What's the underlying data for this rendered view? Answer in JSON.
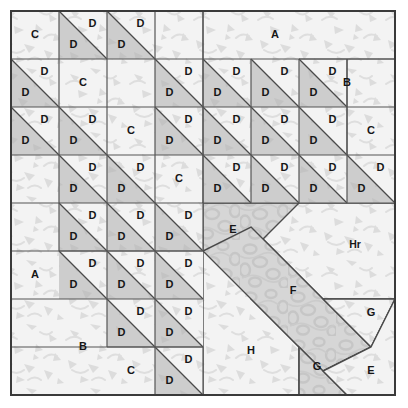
{
  "diagram": {
    "canvas": {
      "width": 408,
      "height": 408,
      "background": "#ffffff"
    },
    "grid": {
      "origin_x": 11,
      "origin_y": 11,
      "cell": 48,
      "columns": 8,
      "rows": 8,
      "line_color": "#555555",
      "border_color": "#3a3a3a"
    },
    "fabrics": {
      "background_light": "#f2f2f2",
      "light_print": "#efefef",
      "medium_gray": "#cfcfcf",
      "mottled_gray": "#d8d8d8",
      "outline": "#4a4a4a"
    },
    "legend_labels": [
      "A",
      "B",
      "C",
      "D",
      "E",
      "F",
      "G",
      "H",
      "Hr"
    ],
    "pieces": [
      {
        "id": "p1",
        "label": "C",
        "fabric": "light",
        "lx": 35,
        "ly": 35
      },
      {
        "id": "p2",
        "label": "A",
        "fabric": "light",
        "lx": 275,
        "ly": 35
      },
      {
        "id": "p3",
        "label": "C",
        "fabric": "light",
        "lx": 83,
        "ly": 83
      },
      {
        "id": "p4",
        "label": "B",
        "fabric": "light",
        "lx": 347,
        "ly": 83
      },
      {
        "id": "p5",
        "label": "C",
        "fabric": "light",
        "lx": 131,
        "ly": 131
      },
      {
        "id": "p6",
        "label": "C",
        "fabric": "light",
        "lx": 371,
        "ly": 131
      },
      {
        "id": "p7",
        "label": "C",
        "fabric": "light",
        "lx": 179,
        "ly": 179
      },
      {
        "id": "p8",
        "label": "A",
        "fabric": "light",
        "lx": 35,
        "ly": 275
      },
      {
        "id": "p9",
        "label": "B",
        "fabric": "light",
        "lx": 83,
        "ly": 347
      },
      {
        "id": "p10",
        "label": "C",
        "fabric": "light",
        "lx": 131,
        "ly": 371
      },
      {
        "id": "p11",
        "label": "E",
        "fabric": "mottled",
        "lx": 233,
        "ly": 230
      },
      {
        "id": "p12",
        "label": "Hr",
        "fabric": "light",
        "lx": 355,
        "ly": 245
      },
      {
        "id": "p13",
        "label": "F",
        "fabric": "mottled",
        "lx": 293,
        "ly": 291
      },
      {
        "id": "p14",
        "label": "G",
        "fabric": "light",
        "lx": 371,
        "ly": 313
      },
      {
        "id": "p15",
        "label": "H",
        "fabric": "light",
        "lx": 251,
        "ly": 351
      },
      {
        "id": "p16",
        "label": "G",
        "fabric": "mottled",
        "lx": 317,
        "ly": 367
      },
      {
        "id": "p17",
        "label": "E",
        "fabric": "light",
        "lx": 371,
        "ly": 371
      }
    ],
    "hst_label": "D",
    "hst_units": [
      {
        "col": 1,
        "row": 0
      },
      {
        "col": 2,
        "row": 0
      },
      {
        "col": 0,
        "row": 1
      },
      {
        "col": 3,
        "row": 1
      },
      {
        "col": 4,
        "row": 1
      },
      {
        "col": 5,
        "row": 1
      },
      {
        "col": 6,
        "row": 1
      },
      {
        "col": 0,
        "row": 2
      },
      {
        "col": 1,
        "row": 2
      },
      {
        "col": 3,
        "row": 2
      },
      {
        "col": 4,
        "row": 2
      },
      {
        "col": 5,
        "row": 2
      },
      {
        "col": 6,
        "row": 2
      },
      {
        "col": 1,
        "row": 3
      },
      {
        "col": 2,
        "row": 3
      },
      {
        "col": 4,
        "row": 3
      },
      {
        "col": 5,
        "row": 3
      },
      {
        "col": 6,
        "row": 3
      },
      {
        "col": 7,
        "row": 3
      },
      {
        "col": 1,
        "row": 4
      },
      {
        "col": 2,
        "row": 4
      },
      {
        "col": 3,
        "row": 4
      },
      {
        "col": 1,
        "row": 5
      },
      {
        "col": 2,
        "row": 5
      },
      {
        "col": 3,
        "row": 5
      },
      {
        "col": 2,
        "row": 6
      },
      {
        "col": 3,
        "row": 6
      },
      {
        "col": 3,
        "row": 7
      }
    ]
  }
}
